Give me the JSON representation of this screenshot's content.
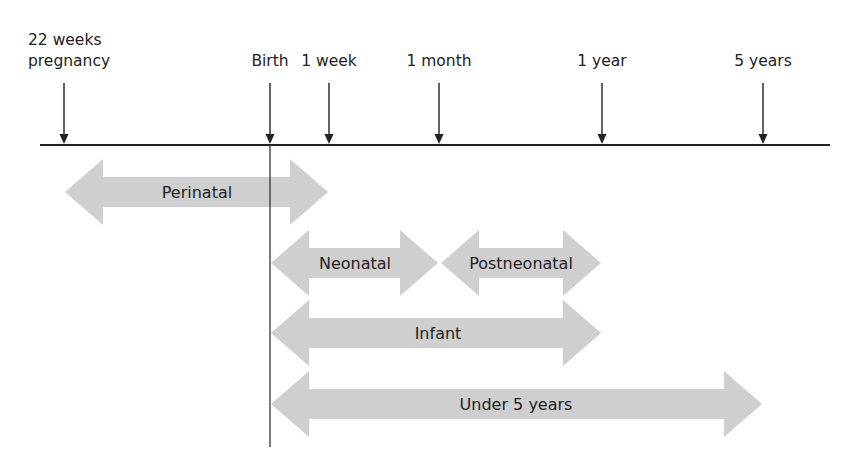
{
  "diagram": {
    "colors": {
      "band": "#cfcfcf",
      "line": "#222222",
      "text": "#222222",
      "background": "#ffffff"
    },
    "axis": {
      "y": 145,
      "x_start": 40,
      "x_end": 830
    },
    "birth_line": {
      "x": 270,
      "y_top": 145,
      "y_bottom": 447
    },
    "ticks": [
      {
        "id": "22-weeks-pregnancy",
        "label_lines": [
          "22 weeks",
          "pregnancy"
        ],
        "x": 64
      },
      {
        "id": "birth",
        "label_lines": [
          "Birth"
        ],
        "x": 270
      },
      {
        "id": "1-week",
        "label_lines": [
          "1 week"
        ],
        "x": 329
      },
      {
        "id": "1-month",
        "label_lines": [
          "1 month"
        ],
        "x": 439
      },
      {
        "id": "1-year",
        "label_lines": [
          "1 year"
        ],
        "x": 602
      },
      {
        "id": "5-years",
        "label_lines": [
          "5 years"
        ],
        "x": 763
      }
    ],
    "bands": [
      {
        "id": "perinatal",
        "label": "Perinatal",
        "from": "22 weeks pregnancy",
        "to": "1 week",
        "x1": 65,
        "x2": 328,
        "cy": 192,
        "label_x": 197
      },
      {
        "id": "neonatal",
        "label": "Neonatal",
        "from": "Birth",
        "to": "1 month",
        "x1": 271,
        "x2": 438,
        "cy": 263,
        "label_x": 355
      },
      {
        "id": "postneonatal",
        "label": "Postneonatal",
        "from": "1 month",
        "to": "1 year",
        "x1": 441,
        "x2": 601,
        "cy": 263,
        "label_x": 521
      },
      {
        "id": "infant",
        "label": "Infant",
        "from": "Birth",
        "to": "1 year",
        "x1": 271,
        "x2": 601,
        "cy": 333,
        "label_x": 438
      },
      {
        "id": "under-5-years",
        "label": "Under 5 years",
        "from": "Birth",
        "to": "5 years",
        "x1": 271,
        "x2": 762,
        "cy": 404,
        "label_x": 516
      }
    ]
  }
}
